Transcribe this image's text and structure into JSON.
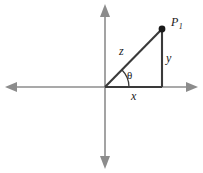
{
  "figure": {
    "background_color": "#ffffff",
    "axis_color": "#8c8c8c",
    "triangle_color": "#3a3a3a",
    "point_color": "#1a1a1a",
    "labels": {
      "point": "P",
      "point_subscript": "1",
      "hypotenuse": "z",
      "vertical_leg": "y",
      "horizontal_leg": "x",
      "angle": "θ"
    },
    "geometry": {
      "origin": {
        "x": 105,
        "y": 87
      },
      "point_p1": {
        "x": 162,
        "y": 29
      },
      "foot_of_perpendicular": {
        "x": 162,
        "y": 87
      },
      "x_axis": {
        "x1": 6,
        "y1": 87,
        "x2": 197,
        "y2": 87
      },
      "y_axis": {
        "x1": 105,
        "y1": 6,
        "x2": 105,
        "y2": 167
      },
      "angle_arc_radius": 24,
      "arrowheads": [
        "left",
        "right",
        "up",
        "down"
      ]
    }
  }
}
